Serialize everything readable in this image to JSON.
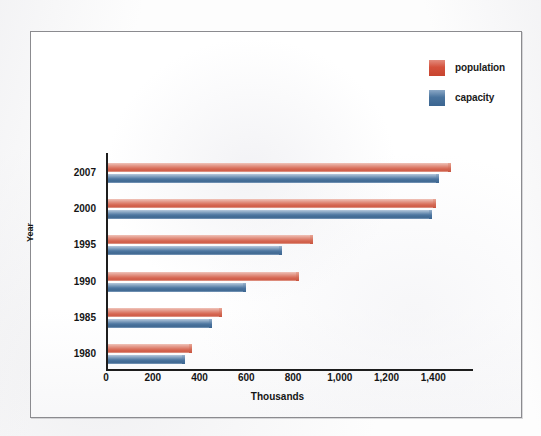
{
  "chart_data": {
    "type": "bar",
    "orientation": "horizontal",
    "title": "",
    "xlabel": "Thousands",
    "ylabel": "Year",
    "categories": [
      "2007",
      "2000",
      "1995",
      "1990",
      "1985",
      "1980"
    ],
    "series": [
      {
        "name": "population",
        "color": "#cf5a45",
        "values": [
          1455,
          1390,
          865,
          805,
          475,
          347
        ]
      },
      {
        "name": "capacity",
        "color": "#4a739e",
        "values": [
          1405,
          1375,
          730,
          578,
          433,
          317
        ]
      }
    ],
    "xticks": [
      "0",
      "200",
      "400",
      "600",
      "800",
      "1,000",
      "1,200",
      "1,400"
    ],
    "xtickvalues": [
      0,
      200,
      400,
      600,
      800,
      1000,
      1200,
      1400
    ],
    "xlim": [
      0,
      1570
    ],
    "grid": false,
    "legend_position": "top-right"
  },
  "legend": {
    "items": [
      {
        "label": "population",
        "swatch": "population-swatch"
      },
      {
        "label": "capacity",
        "swatch": "capacity-swatch"
      }
    ]
  },
  "axes": {
    "y_title": "Year",
    "x_title": "Thousands"
  },
  "colors": {
    "population": "#cf5a45",
    "capacity": "#4a739e",
    "axis": "#1d1d1d",
    "frame": "#8b8b8f",
    "background": "#ffffff"
  }
}
